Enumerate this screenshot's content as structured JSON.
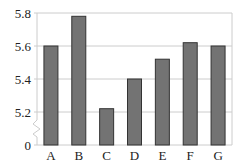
{
  "chart_data": {
    "type": "bar",
    "title": "",
    "xlabel": "",
    "ylabel": "",
    "categories": [
      "A",
      "B",
      "C",
      "D",
      "E",
      "F",
      "G"
    ],
    "values": [
      5.6,
      5.78,
      5.22,
      5.4,
      5.52,
      5.62,
      5.6
    ],
    "ylim": [
      5.2,
      5.8
    ],
    "axis_break": true,
    "y_ticks": [
      "0",
      "5.2",
      "5.4",
      "5.6",
      "5.8"
    ],
    "grid": true,
    "legend": null
  },
  "colors": {
    "bar_fill": "#737373",
    "bar_stroke": "#333333",
    "grid": "#cccccc",
    "frame": "#cccccc",
    "text": "#222222"
  }
}
